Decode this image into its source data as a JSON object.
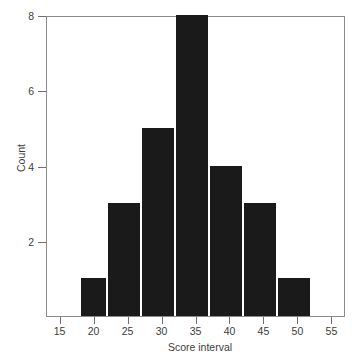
{
  "chart_data": {
    "type": "bar",
    "title": "",
    "subtitle": "",
    "xlabel": "Score interval",
    "ylabel": "Count",
    "categories": [
      "20",
      "25",
      "30",
      "35",
      "40",
      "45",
      "50"
    ],
    "values": [
      1,
      3,
      5,
      8,
      4,
      3,
      1
    ],
    "bin_edges": [
      18,
      22,
      27,
      32,
      37,
      42,
      47,
      52
    ],
    "bin_width": 5,
    "xlim": [
      13,
      57
    ],
    "ylim": [
      0,
      8
    ],
    "x_ticks": [
      "15",
      "20",
      "25",
      "30",
      "35",
      "40",
      "45",
      "50",
      "55"
    ],
    "x_tick_values": [
      15,
      20,
      25,
      30,
      35,
      40,
      45,
      50,
      55
    ],
    "y_ticks": [
      "2",
      "4",
      "6",
      "8"
    ],
    "y_tick_values": [
      2,
      4,
      6,
      8
    ],
    "grid": false,
    "legend": null,
    "legend_position": "none",
    "annotations": [],
    "bars": [
      {
        "label": "20",
        "value": 1,
        "left_edge": 18,
        "right_edge": 22
      },
      {
        "label": "25",
        "value": 3,
        "left_edge": 22,
        "right_edge": 27
      },
      {
        "label": "30",
        "value": 5,
        "left_edge": 27,
        "right_edge": 32
      },
      {
        "label": "35",
        "value": 8,
        "left_edge": 32,
        "right_edge": 37
      },
      {
        "label": "40",
        "value": 4,
        "left_edge": 37,
        "right_edge": 42
      },
      {
        "label": "45",
        "value": 3,
        "left_edge": 42,
        "right_edge": 47
      },
      {
        "label": "50",
        "value": 1,
        "left_edge": 47,
        "right_edge": 52
      }
    ],
    "total_count": 25
  },
  "style": {
    "bar_color": "#1a1a1a",
    "frame_color": "#8a8a8a",
    "tick_color": "#6f6f6f",
    "text_color": "#3d3d3d",
    "background": "#ffffff"
  }
}
